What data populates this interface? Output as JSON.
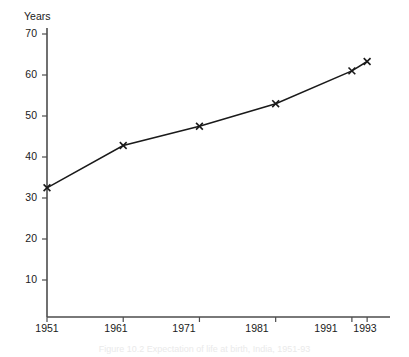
{
  "figure": {
    "caption": "Figure 10.2  Expectation of life at birth, India, 1951-93"
  },
  "chart_data": {
    "type": "line",
    "title": "",
    "xlabel": "",
    "ylabel": "Years",
    "x": [
      1951,
      1961,
      1971,
      1981,
      1991,
      1993
    ],
    "categories": [
      "1951",
      "1961",
      "1971",
      "1981",
      "1991",
      "1993"
    ],
    "values": [
      32.5,
      42.8,
      47.5,
      53.0,
      61.0,
      63.3
    ],
    "series": [
      {
        "name": "Expectation of life at birth",
        "values": [
          32.5,
          42.8,
          47.5,
          53.0,
          61.0,
          63.3
        ]
      }
    ],
    "xlim": [
      1951,
      1996
    ],
    "ylim": [
      0,
      70
    ],
    "xticks": [
      1951,
      1961,
      1971,
      1981,
      1991,
      1993
    ],
    "xtick_labels": [
      "1951",
      "1961",
      "1971",
      "1981",
      "1991",
      "1993"
    ],
    "yticks": [
      10,
      20,
      30,
      40,
      50,
      60,
      70
    ],
    "ytick_labels": [
      "10",
      "20",
      "30",
      "40",
      "50",
      "60",
      "70"
    ],
    "grid": false,
    "legend": false,
    "marker": "x",
    "line_color": "#1a1a1a",
    "axis_color": "#4d4d4d"
  }
}
